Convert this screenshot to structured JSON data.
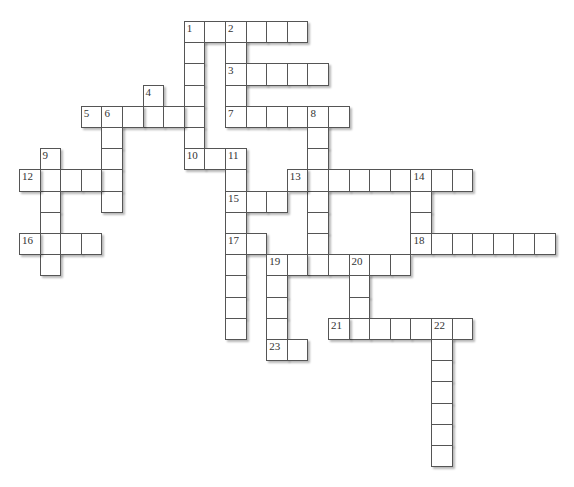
{
  "puzzle": {
    "type": "crossword",
    "grid": {
      "origin_x": 19,
      "origin_y": 21,
      "cell_w": 20.6,
      "cell_h": 21.2
    },
    "colors": {
      "cell_bg": "#ffffff",
      "cell_border": "#555555",
      "number": "#333333"
    },
    "words": [
      {
        "num": "1",
        "dir": "across",
        "row": 0,
        "col": 8,
        "len": 6
      },
      {
        "num": "1",
        "dir": "down",
        "row": 0,
        "col": 8,
        "len": 7
      },
      {
        "num": "2",
        "dir": "down",
        "row": 0,
        "col": 10,
        "len": 5
      },
      {
        "num": "3",
        "dir": "across",
        "row": 2,
        "col": 10,
        "len": 5
      },
      {
        "num": "4",
        "dir": "down",
        "row": 3,
        "col": 6,
        "len": 2
      },
      {
        "num": "5",
        "dir": "across",
        "row": 4,
        "col": 3,
        "len": 6
      },
      {
        "num": "6",
        "dir": "down",
        "row": 4,
        "col": 4,
        "len": 5
      },
      {
        "num": "7",
        "dir": "across",
        "row": 4,
        "col": 10,
        "len": 6
      },
      {
        "num": "8",
        "dir": "down",
        "row": 4,
        "col": 14,
        "len": 8
      },
      {
        "num": "9",
        "dir": "down",
        "row": 6,
        "col": 1,
        "len": 6
      },
      {
        "num": "10",
        "dir": "across",
        "row": 6,
        "col": 8,
        "len": 3
      },
      {
        "num": "11",
        "dir": "down",
        "row": 6,
        "col": 10,
        "len": 9
      },
      {
        "num": "12",
        "dir": "across",
        "row": 7,
        "col": 0,
        "len": 5
      },
      {
        "num": "13",
        "dir": "across",
        "row": 7,
        "col": 13,
        "len": 9
      },
      {
        "num": "14",
        "dir": "down",
        "row": 7,
        "col": 19,
        "len": 4
      },
      {
        "num": "15",
        "dir": "across",
        "row": 8,
        "col": 10,
        "len": 3
      },
      {
        "num": "16",
        "dir": "across",
        "row": 10,
        "col": 0,
        "len": 4
      },
      {
        "num": "17",
        "dir": "across",
        "row": 10,
        "col": 10,
        "len": 2
      },
      {
        "num": "18",
        "dir": "across",
        "row": 10,
        "col": 19,
        "len": 7
      },
      {
        "num": "19",
        "dir": "across",
        "row": 11,
        "col": 12,
        "len": 7
      },
      {
        "num": "19",
        "dir": "down",
        "row": 11,
        "col": 12,
        "len": 5
      },
      {
        "num": "20",
        "dir": "down",
        "row": 11,
        "col": 16,
        "len": 4
      },
      {
        "num": "21",
        "dir": "across",
        "row": 14,
        "col": 15,
        "len": 7
      },
      {
        "num": "22",
        "dir": "down",
        "row": 14,
        "col": 20,
        "len": 7
      },
      {
        "num": "23",
        "dir": "across",
        "row": 15,
        "col": 12,
        "len": 2
      }
    ]
  }
}
